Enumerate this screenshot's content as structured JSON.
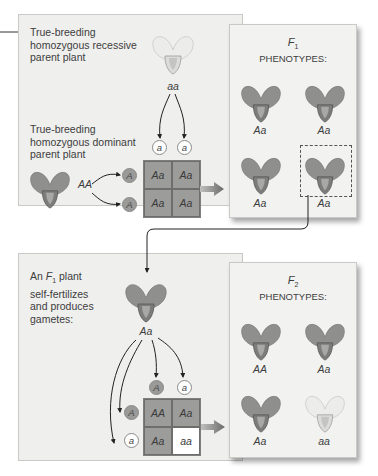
{
  "top": {
    "recessive_parent_label": "True-breeding homozygous recessive parent plant",
    "recessive_parent_label_lines": [
      "True-breeding",
      "homozygous recessive",
      "parent plant"
    ],
    "recessive_genotype": "aa",
    "dominant_parent_label_lines": [
      "True-breeding",
      "homozygous dominant",
      "parent plant"
    ],
    "dominant_genotype": "AA",
    "gametes_top": [
      "a",
      "a"
    ],
    "gametes_left": [
      "A",
      "A"
    ],
    "punnett": [
      [
        "Aa",
        "Aa"
      ],
      [
        "Aa",
        "Aa"
      ]
    ]
  },
  "f1": {
    "title_symbol": "F",
    "title_sub": "1",
    "title_text": "PHENOTYPES:",
    "plants": [
      {
        "genotype": "Aa",
        "color": "purple"
      },
      {
        "genotype": "Aa",
        "color": "purple"
      },
      {
        "genotype": "Aa",
        "color": "purple"
      },
      {
        "genotype": "Aa",
        "color": "purple",
        "selected": true
      }
    ]
  },
  "bottom": {
    "intro_prefix": "An",
    "intro_symbol": "F",
    "intro_sub": "1",
    "intro_lines": [
      "plant",
      "self-fertilizes",
      "and produces",
      "gametes:"
    ],
    "parent_genotype": "Aa",
    "gametes_top": [
      "A",
      "a"
    ],
    "gametes_left": [
      "A",
      "a"
    ],
    "punnett": [
      [
        "AA",
        "Aa"
      ],
      [
        "Aa",
        "aa"
      ]
    ]
  },
  "f2": {
    "title_symbol": "F",
    "title_sub": "2",
    "title_text": "PHENOTYPES:",
    "plants": [
      {
        "genotype": "AA",
        "color": "purple"
      },
      {
        "genotype": "Aa",
        "color": "purple"
      },
      {
        "genotype": "Aa",
        "color": "purple"
      },
      {
        "genotype": "aa",
        "color": "white"
      }
    ]
  },
  "colors": {
    "panel_bg": "#efefee",
    "dominant_cell": "#9c9c9a",
    "purple_flower": "#8f8f8d",
    "white_flower": "#e9e9e7",
    "arrow": "#6b6b69"
  }
}
